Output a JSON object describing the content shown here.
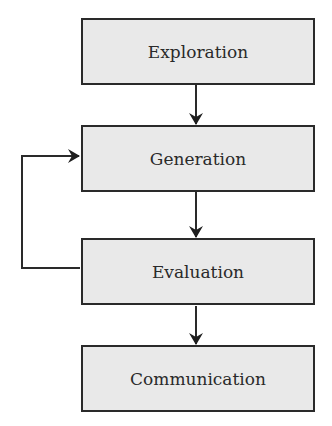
{
  "diagram": {
    "nodes": [
      {
        "id": "exploration",
        "label": "Exploration"
      },
      {
        "id": "generation",
        "label": "Generation"
      },
      {
        "id": "evaluation",
        "label": "Evaluation"
      },
      {
        "id": "communication",
        "label": "Communication"
      }
    ],
    "edges": [
      {
        "from": "exploration",
        "to": "generation"
      },
      {
        "from": "generation",
        "to": "evaluation"
      },
      {
        "from": "evaluation",
        "to": "communication"
      },
      {
        "from": "evaluation",
        "to": "generation",
        "type": "feedback-loop"
      }
    ],
    "colors": {
      "box_fill": "#e9e9e9",
      "stroke": "#2a2a2a",
      "background": "#ffffff"
    }
  }
}
